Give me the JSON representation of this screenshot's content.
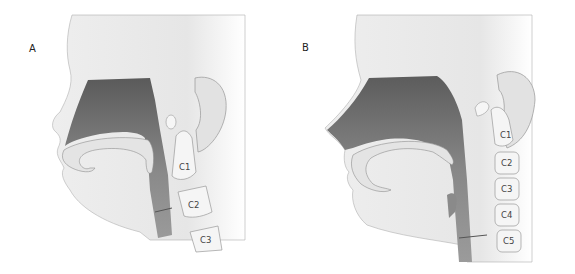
{
  "panels": [
    {
      "label": "A",
      "description": "Infant head sagittal section",
      "vertebrae": [
        "C1",
        "C2",
        "C3"
      ]
    },
    {
      "label": "B",
      "description": "Adult head sagittal section",
      "vertebrae": [
        "C1",
        "C2",
        "C3",
        "C4",
        "C5"
      ]
    }
  ],
  "colors": {
    "skin": "#e9e9e9",
    "airway": "#7a7a7a",
    "bone": "#f4f4f4",
    "outline": "#9a9a9a"
  }
}
